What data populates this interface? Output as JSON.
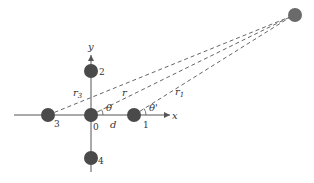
{
  "diagram": {
    "type": "geometry",
    "axes": {
      "x_label": "x",
      "y_label": "y"
    },
    "points": [
      {
        "id": "0",
        "label": "0"
      },
      {
        "id": "1",
        "label": "1"
      },
      {
        "id": "2",
        "label": "2"
      },
      {
        "id": "3",
        "label": "3"
      },
      {
        "id": "4",
        "label": "4"
      },
      {
        "id": "far",
        "label": ""
      }
    ],
    "distance_labels": {
      "r": "r",
      "r1": "r",
      "r1_sub": "1",
      "r3": "r",
      "r3_sub": "3",
      "d": "d"
    },
    "angle_labels": {
      "theta": "θ",
      "theta_prime": "θ'"
    },
    "colors": {
      "point_fill": "#4a4a4a",
      "far_point_fill": "#6a6a6a",
      "axis": "#555555",
      "dashed": "#666666",
      "text": "#333333"
    }
  }
}
